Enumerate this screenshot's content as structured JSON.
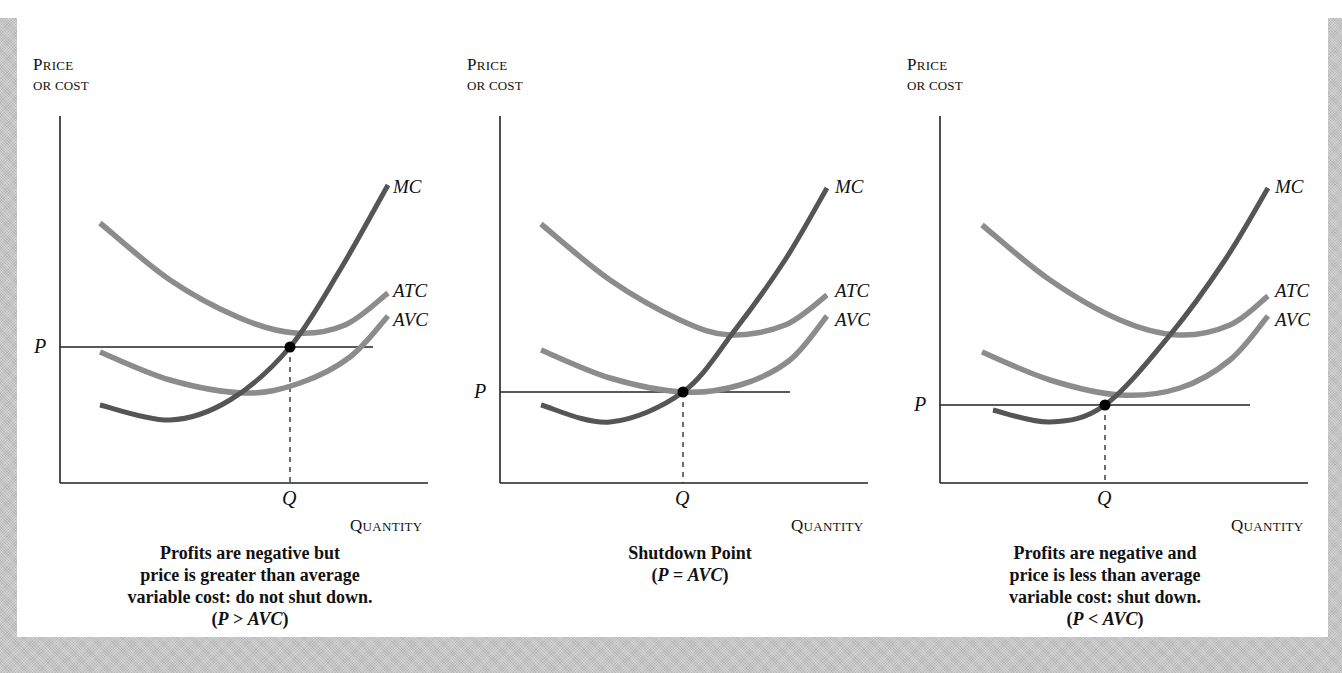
{
  "figure": {
    "border_color": "#c4c4c4",
    "background": "#ffffff",
    "curve_colors": {
      "MC": "#555555",
      "ATC": "#8c8c8c",
      "AVC": "#8c8c8c"
    }
  },
  "chart_data": [
    {
      "type": "line",
      "title": "Profits are negative but price is greater than average variable cost: do not shut down.",
      "condition": "(P > AVC)",
      "ylabel": "PRICE OR COST",
      "xlabel": "QUANTITY",
      "tick_labels": {
        "y": "P",
        "x": "Q"
      },
      "series": [
        {
          "name": "MC",
          "points": [
            [
              100,
              405
            ],
            [
              170,
              420
            ],
            [
              230,
              400
            ],
            [
              290,
              347
            ],
            [
              340,
              270
            ],
            [
              388,
              185
            ]
          ]
        },
        {
          "name": "ATC",
          "points": [
            [
              100,
              223
            ],
            [
              170,
              280
            ],
            [
              240,
              318
            ],
            [
              295,
              333
            ],
            [
              345,
              325
            ],
            [
              388,
              293
            ]
          ]
        },
        {
          "name": "AVC",
          "points": [
            [
              100,
              352
            ],
            [
              170,
              380
            ],
            [
              245,
              393
            ],
            [
              300,
              383
            ],
            [
              350,
              357
            ],
            [
              388,
              316
            ]
          ]
        }
      ],
      "price_level_y": 347,
      "equilibrium": {
        "x": 290,
        "y": 347
      },
      "axes": {
        "origin": [
          60,
          483
        ],
        "y_top": 116,
        "x_right": 428
      },
      "price_line_end_x": 373
    },
    {
      "type": "line",
      "title": "Shutdown Point",
      "condition": "(P = AVC)",
      "ylabel": "PRICE OR COST",
      "xlabel": "QUANTITY",
      "tick_labels": {
        "y": "P",
        "x": "Q"
      },
      "series": [
        {
          "name": "MC",
          "points": [
            [
              541,
              405
            ],
            [
              610,
              422
            ],
            [
              683,
              392
            ],
            [
              735,
              330
            ],
            [
              785,
              260
            ],
            [
              827,
              188
            ]
          ]
        },
        {
          "name": "ATC",
          "points": [
            [
              541,
              224
            ],
            [
              610,
              280
            ],
            [
              680,
              320
            ],
            [
              730,
              335
            ],
            [
              785,
              325
            ],
            [
              827,
              295
            ]
          ]
        },
        {
          "name": "AVC",
          "points": [
            [
              541,
              350
            ],
            [
              610,
              378
            ],
            [
              683,
              392
            ],
            [
              740,
              385
            ],
            [
              790,
              360
            ],
            [
              827,
              316
            ]
          ]
        }
      ],
      "price_level_y": 392,
      "equilibrium": {
        "x": 683,
        "y": 392
      },
      "axes": {
        "origin": [
          500,
          483
        ],
        "y_top": 116,
        "x_right": 868
      },
      "price_line_end_x": 790
    },
    {
      "type": "line",
      "title": "Profits are negative and price is less than average variable cost: shut down.",
      "condition": "(P < AVC)",
      "ylabel": "PRICE OR COST",
      "xlabel": "QUANTITY",
      "tick_labels": {
        "y": "P",
        "x": "Q"
      },
      "series": [
        {
          "name": "MC",
          "points": [
            [
              993,
              410
            ],
            [
              1050,
              422
            ],
            [
              1105,
              405
            ],
            [
              1170,
              335
            ],
            [
              1225,
              260
            ],
            [
              1268,
              188
            ]
          ]
        },
        {
          "name": "ATC",
          "points": [
            [
              982,
              225
            ],
            [
              1050,
              280
            ],
            [
              1120,
              320
            ],
            [
              1178,
              335
            ],
            [
              1230,
              325
            ],
            [
              1268,
              296
            ]
          ]
        },
        {
          "name": "AVC",
          "points": [
            [
              982,
              352
            ],
            [
              1050,
              380
            ],
            [
              1120,
              395
            ],
            [
              1180,
              388
            ],
            [
              1230,
              360
            ],
            [
              1268,
              316
            ]
          ]
        }
      ],
      "price_level_y": 405,
      "equilibrium": {
        "x": 1105,
        "y": 405
      },
      "axes": {
        "origin": [
          940,
          483
        ],
        "y_top": 116,
        "x_right": 1308
      },
      "price_line_end_x": 1250
    }
  ],
  "panels": [
    {
      "ylabel_line1": "PRICE",
      "ylabel_line2": "OR COST",
      "xlabel": "QUANTITY",
      "p_label": "P",
      "q_label": "Q",
      "curve_labels": {
        "mc": "MC",
        "atc": "ATC",
        "avc": "AVC"
      },
      "caption_lines": [
        "Profits are negative but",
        "price is greater than average",
        "variable cost: do not shut down."
      ],
      "condition_open": "(",
      "condition_p": "P",
      "condition_op": " > ",
      "condition_avc": "AVC",
      "condition_close": ")"
    },
    {
      "ylabel_line1": "PRICE",
      "ylabel_line2": "OR COST",
      "xlabel": "QUANTITY",
      "p_label": "P",
      "q_label": "Q",
      "curve_labels": {
        "mc": "MC",
        "atc": "ATC",
        "avc": "AVC"
      },
      "caption_lines": [
        "Shutdown Point"
      ],
      "condition_open": "(",
      "condition_p": "P",
      "condition_op": " = ",
      "condition_avc": "AVC",
      "condition_close": ")"
    },
    {
      "ylabel_line1": "PRICE",
      "ylabel_line2": "OR COST",
      "xlabel": "QUANTITY",
      "p_label": "P",
      "q_label": "Q",
      "curve_labels": {
        "mc": "MC",
        "atc": "ATC",
        "avc": "AVC"
      },
      "caption_lines": [
        "Profits are negative and",
        "price is less than average",
        "variable cost: shut down."
      ],
      "condition_open": "(",
      "condition_p": "P",
      "condition_op": " < ",
      "condition_avc": "AVC",
      "condition_close": ")"
    }
  ]
}
